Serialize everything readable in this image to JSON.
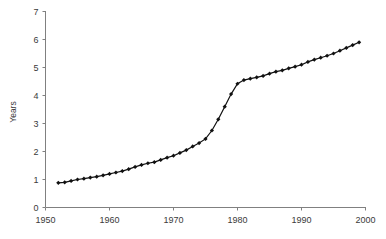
{
  "chart_data": {
    "type": "line",
    "title": "",
    "subtitle": "",
    "xlabel": "",
    "ylabel": "Years",
    "xlim": [
      1950,
      2000
    ],
    "ylim": [
      0,
      7
    ],
    "xticks": [
      1950,
      1960,
      1970,
      1980,
      1990,
      2000
    ],
    "yticks": [
      0,
      1,
      2,
      3,
      4,
      5,
      6,
      7
    ],
    "xtick_labels": [
      "1950",
      "1960",
      "1970",
      "1980",
      "1990",
      "2000"
    ],
    "ytick_labels": [
      "0",
      "1",
      "2",
      "3",
      "4",
      "5",
      "6",
      "7"
    ],
    "grid": false,
    "legend": null,
    "legend_position": "none",
    "marker": "diamond",
    "marker_color": "#111111",
    "line_color": "#111111",
    "axis_color": "#808080",
    "series": [
      {
        "name": "Years",
        "x": [
          1952,
          1953,
          1954,
          1955,
          1956,
          1957,
          1958,
          1959,
          1960,
          1961,
          1962,
          1963,
          1964,
          1965,
          1966,
          1967,
          1968,
          1969,
          1970,
          1971,
          1972,
          1973,
          1974,
          1975,
          1976,
          1977,
          1978,
          1979,
          1980,
          1981,
          1982,
          1983,
          1984,
          1985,
          1986,
          1987,
          1988,
          1989,
          1990,
          1991,
          1992,
          1993,
          1994,
          1995,
          1996,
          1997,
          1998,
          1999
        ],
        "values": [
          0.88,
          0.9,
          0.95,
          1.0,
          1.03,
          1.07,
          1.1,
          1.15,
          1.2,
          1.25,
          1.3,
          1.37,
          1.45,
          1.52,
          1.58,
          1.62,
          1.7,
          1.78,
          1.85,
          1.95,
          2.05,
          2.18,
          2.3,
          2.45,
          2.75,
          3.15,
          3.6,
          4.05,
          4.42,
          4.55,
          4.6,
          4.65,
          4.7,
          4.78,
          4.85,
          4.9,
          4.97,
          5.03,
          5.1,
          5.2,
          5.28,
          5.35,
          5.42,
          5.5,
          5.6,
          5.7,
          5.8,
          5.9
        ]
      }
    ]
  },
  "axes": {
    "ylabel": "Years"
  }
}
